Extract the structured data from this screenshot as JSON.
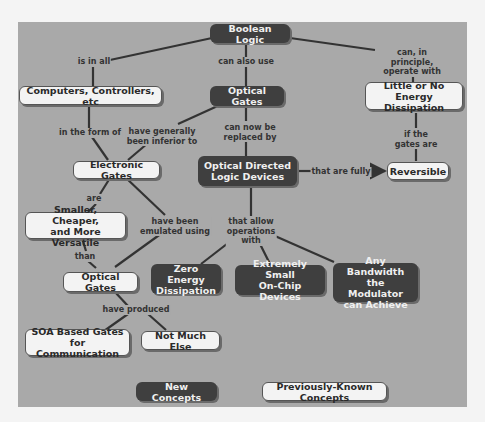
{
  "nodes": {
    "boolean_logic": {
      "label": "Boolean Logic",
      "type": "new"
    },
    "computers": {
      "label": "Computers, Controllers, etc",
      "type": "known"
    },
    "optical_gates_top": {
      "label": "Optical Gates",
      "type": "new"
    },
    "little_energy": {
      "label": "Little or No\nEnergy Dissipation",
      "type": "known"
    },
    "electronic_gates": {
      "label": "Electronic Gates",
      "type": "known"
    },
    "optical_directed": {
      "label": "Optical  Directed\nLogic Devices",
      "type": "new"
    },
    "reversible": {
      "label": "Reversible",
      "type": "known"
    },
    "smaller": {
      "label": "Smaller, Cheaper,\nand More Versatile",
      "type": "known"
    },
    "optical_gates_bottom": {
      "label": "Optical Gates",
      "type": "known"
    },
    "zero_energy": {
      "label": "Zero Energy\nDissipation",
      "type": "new"
    },
    "extremely_small": {
      "label": "Extremely Small\nOn-Chip Devices",
      "type": "new"
    },
    "any_bandwidth": {
      "label": "Any Bandwidth\nthe Modulator\ncan Achieve",
      "type": "new"
    },
    "soa_gates": {
      "label": "SOA Based Gates\nfor Communication",
      "type": "known"
    },
    "not_much_else": {
      "label": "Not Much Else",
      "type": "known"
    }
  },
  "links": {
    "is_in_all": "is in all",
    "can_also_use": "can also use",
    "can_in_principle": "can, in principle,\noperate with",
    "in_the_form_of": "in the form of",
    "have_generally": "have generally\nbeen inferior to",
    "can_now_be": "can now be\nreplaced by",
    "if_the_gates": "if  the\ngates are",
    "that_are_fully": "that are fully",
    "are": "are",
    "have_been_emulated": "have been\nemulated using",
    "that_allow": "that allow\noperations\nwith",
    "than": "than",
    "have_produced": "have produced"
  },
  "legend": {
    "new": "New Concepts",
    "known": "Previously-Known Concepts"
  },
  "colors": {
    "panel": "#a9a9a9",
    "new_concept_fill": "#3f3f3f",
    "known_concept_fill": "#f3f3f3",
    "edge": "#333333"
  }
}
